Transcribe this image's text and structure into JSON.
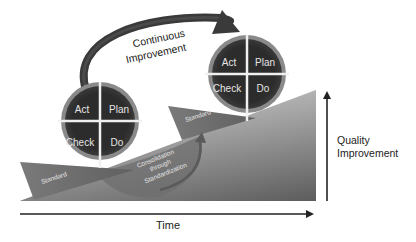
{
  "diagram": {
    "arc_label": [
      "Continuous",
      "Improvement"
    ],
    "pdca_cycles": [
      {
        "id": "cycle-1",
        "quadrants": {
          "top_left": "Act",
          "top_right": "Plan",
          "bottom_left": "Check",
          "bottom_right": "Do"
        }
      },
      {
        "id": "cycle-2",
        "quadrants": {
          "top_left": "Act",
          "top_right": "Plan",
          "bottom_left": "Check",
          "bottom_right": "Do"
        }
      }
    ],
    "wedges": {
      "standard_1": "Standard",
      "standard_2": "Standard",
      "consolidation": [
        "Consolidation",
        "through",
        "Standardization"
      ]
    },
    "axes": {
      "x_label": "Time",
      "y_label": [
        "Quality",
        "Improvement"
      ]
    },
    "colors": {
      "circle_fill": "#2f2f2f",
      "circle_ring": "#8c8c8c",
      "divider": "#f0f0f0",
      "arc": "#3a3a3a",
      "ramp_light": "#d0d0d0",
      "ramp_dark": "#6a6a6a",
      "wedge": "#707070",
      "axis": "#222222"
    }
  }
}
